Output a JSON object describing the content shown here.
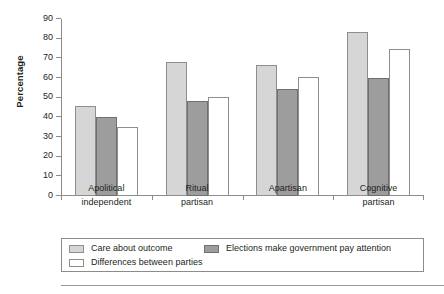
{
  "chart_data": {
    "type": "bar",
    "title": "",
    "subtitle": "",
    "xlabel": "",
    "ylabel": "Percentage",
    "ylim": [
      0,
      90
    ],
    "ytick_step": 10,
    "yticks": [
      0,
      10,
      20,
      30,
      40,
      50,
      60,
      70,
      80,
      90
    ],
    "ytick_labels": [
      "0",
      "10",
      "20",
      "30",
      "40",
      "50",
      "60",
      "70",
      "80",
      "90"
    ],
    "grid": false,
    "legend_position": "bottom",
    "categories": [
      "Apolitical\nindependent",
      "Ritual\npartisan",
      "Apartisan",
      "Cognitive\npartisan"
    ],
    "category_lines": [
      [
        "Apolitical",
        "independent"
      ],
      [
        "Ritual",
        "partisan"
      ],
      [
        "Apartisan",
        ""
      ],
      [
        "Cognitive",
        "partisan"
      ]
    ],
    "series": [
      {
        "name": "Care about outcome",
        "color": "#d6d6d6",
        "edge": "#8e8e8e",
        "values": [
          46,
          68,
          66.5,
          83.5
        ]
      },
      {
        "name": "Elections make government pay attention",
        "color": "#9d9d9d",
        "edge": "#6f6f6f",
        "values": [
          40,
          48.5,
          54.5,
          60
        ]
      },
      {
        "name": "Differences between parties",
        "color": "#ffffff",
        "edge": "#8e8e8e",
        "values": [
          35,
          50.5,
          60.5,
          75
        ]
      }
    ]
  },
  "legend": {
    "items": [
      {
        "label": "Care about outcome",
        "swatch": "light-gray-swatch"
      },
      {
        "label": "Elections make government pay attention",
        "swatch": "mid-gray-swatch"
      },
      {
        "label": "Differences between parties",
        "swatch": "white-swatch"
      }
    ]
  }
}
